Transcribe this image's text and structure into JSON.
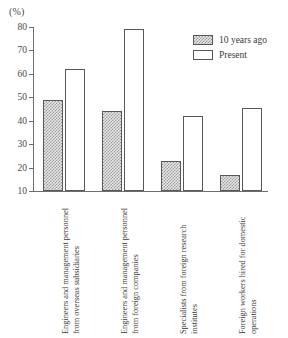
{
  "chart_data": {
    "type": "bar",
    "title": "",
    "xlabel": "",
    "ylabel": "(%)",
    "ylim": [
      10,
      80
    ],
    "yticks": [
      10,
      20,
      30,
      40,
      50,
      60,
      70,
      80
    ],
    "grid": false,
    "legend_position": "top-right",
    "categories": [
      "Engineers and management personnel from overseas subsidiaries",
      "Engineers and management personnel from foreign companies",
      "Specialists from foreign research institutes",
      "Foreign workers hired for domestic operations"
    ],
    "series": [
      {
        "name": "10 years ago",
        "values": [
          49,
          44,
          23,
          17
        ]
      },
      {
        "name": "Present",
        "values": [
          62,
          79,
          42,
          45.5
        ]
      }
    ]
  },
  "axis": {
    "unit_label": "(%)",
    "tick_labels": [
      "80",
      "70",
      "60",
      "50",
      "40",
      "30",
      "20",
      "10"
    ]
  },
  "legend": {
    "items": [
      {
        "label": "10 years ago",
        "swatch": "hatched-swatch"
      },
      {
        "label": "Present",
        "swatch": "white-swatch"
      }
    ]
  },
  "colors": {
    "axis": "#6e6e6e",
    "bar_outline": "#585858",
    "hatch_fill": "#9a9a9a",
    "hatch_bg": "#e8e8e8",
    "present_fill": "#ffffff",
    "text": "#3a3a3a",
    "background": "#ffffff"
  }
}
